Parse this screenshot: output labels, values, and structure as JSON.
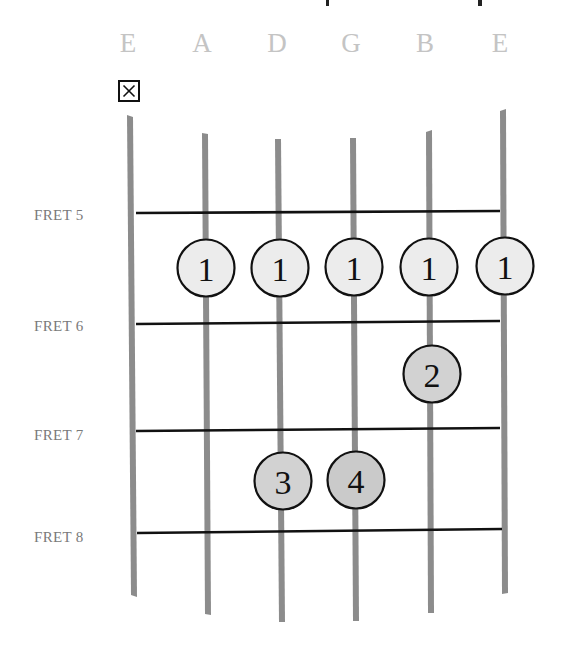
{
  "diagram": {
    "type": "guitar-chord-chart",
    "strings": [
      {
        "name": "E",
        "index": 6,
        "state": "muted"
      },
      {
        "name": "A",
        "index": 5,
        "state": "fretted"
      },
      {
        "name": "D",
        "index": 4,
        "state": "fretted"
      },
      {
        "name": "G",
        "index": 3,
        "state": "fretted"
      },
      {
        "name": "B",
        "index": 2,
        "state": "fretted"
      },
      {
        "name": "E",
        "index": 1,
        "state": "fretted"
      }
    ],
    "mute_marker": {
      "string": "E (low)",
      "symbol": "X"
    },
    "frets": [
      {
        "label": "FRET 5"
      },
      {
        "label": "FRET 6"
      },
      {
        "label": "FRET 7"
      },
      {
        "label": "FRET 8"
      }
    ],
    "finger_dots": [
      {
        "string": "A",
        "fret": 5,
        "finger": "1"
      },
      {
        "string": "D",
        "fret": 5,
        "finger": "1"
      },
      {
        "string": "G",
        "fret": 5,
        "finger": "1"
      },
      {
        "string": "B",
        "fret": 5,
        "finger": "1"
      },
      {
        "string": "E",
        "fret": 5,
        "finger": "1"
      },
      {
        "string": "B",
        "fret": 6,
        "finger": "2"
      },
      {
        "string": "D",
        "fret": 7,
        "finger": "3"
      },
      {
        "string": "G",
        "fret": 7,
        "finger": "4"
      }
    ],
    "colors": {
      "string": "#8c8c8c",
      "fret_line": "#111111",
      "barre_dot_fill": "#ececec",
      "finger_dot_fill": "#cfcfcf",
      "dot_outline": "#111111",
      "string_name": "#c4c4c4",
      "fret_label": "#7a7a7a"
    }
  }
}
